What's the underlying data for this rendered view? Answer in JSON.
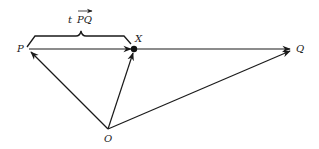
{
  "diagram": {
    "points": {
      "P": {
        "label": "P"
      },
      "X": {
        "label": "X"
      },
      "Q": {
        "label": "Q"
      },
      "O": {
        "label": "O"
      }
    },
    "brace_label": {
      "scalar": "t",
      "vector": "PQ"
    },
    "vectors": [
      {
        "from": "O",
        "to": "P"
      },
      {
        "from": "O",
        "to": "X"
      },
      {
        "from": "O",
        "to": "Q"
      },
      {
        "from": "P",
        "to": "X"
      },
      {
        "from": "X",
        "to": "Q"
      }
    ],
    "stroke_color": "#1a1a1a"
  }
}
